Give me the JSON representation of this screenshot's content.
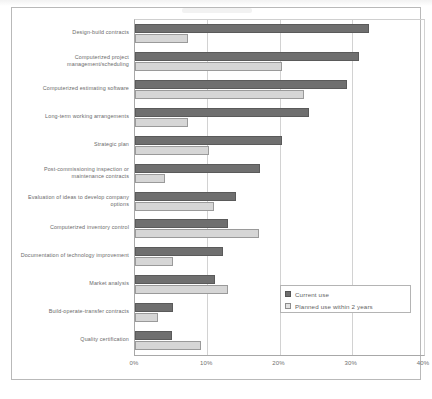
{
  "chart_data": {
    "type": "bar",
    "orientation": "horizontal",
    "title": "",
    "xlabel": "",
    "ylabel": "",
    "xlim": [
      0,
      40
    ],
    "xticks": [
      "0%",
      "10%",
      "20%",
      "30%",
      "40%"
    ],
    "xtick_values": [
      0,
      10,
      20,
      30,
      40
    ],
    "grid": true,
    "legend_position": "bottom-right",
    "categories": [
      "Design-build contracts",
      "Computerized project management/scheduling",
      "Computerized estimating software",
      "Long-term working arrangements",
      "Strategic plan",
      "Post-commissioning inspection or maintenance contracts",
      "Evaluation of ideas to develop company options",
      "Computerized inventory control",
      "Documentation of technology improvement",
      "Market analysis",
      "Build-operate-transfer contracts",
      "Quality certification"
    ],
    "series": [
      {
        "name": "Current use",
        "color": "#6f6f6f",
        "values": [
          32.4,
          31.0,
          29.3,
          24.1,
          20.3,
          17.3,
          14.0,
          12.9,
          12.2,
          11.1,
          5.2,
          5.1
        ]
      },
      {
        "name": "Planned use within 2 years",
        "color": "#d6d6d6",
        "values": [
          7.3,
          20.3,
          23.4,
          7.3,
          10.3,
          4.1,
          11.0,
          17.2,
          5.2,
          12.9,
          3.2,
          9.1
        ]
      }
    ]
  },
  "legend": {
    "items": [
      {
        "label": "Current use",
        "swatch": "filled-dark-square"
      },
      {
        "label": "Planned use within 2 years",
        "swatch": "hatched-light-square"
      }
    ]
  }
}
